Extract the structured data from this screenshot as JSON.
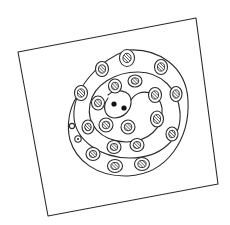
{
  "diagram": {
    "colors": {
      "ink": "#2b2b2b",
      "background": "#ffffff",
      "dot": "#111111"
    },
    "frame": {
      "corners": [
        [
          18,
          52
        ],
        [
          196,
          18
        ],
        [
          218,
          184
        ],
        [
          48,
          216
        ]
      ]
    },
    "center_dots": [
      {
        "cx": 114,
        "cy": 104,
        "r": 2.6
      },
      {
        "cx": 124,
        "cy": 108,
        "r": 2.6
      }
    ],
    "cells": [
      {
        "cx": 127,
        "cy": 58,
        "rx": 7.5,
        "ry": 8.5,
        "ring": "outer"
      },
      {
        "cx": 102,
        "cy": 69,
        "rx": 6.5,
        "ry": 7.5,
        "ring": "outer"
      },
      {
        "cx": 161,
        "cy": 67,
        "rx": 6.5,
        "ry": 7.5,
        "ring": "outer"
      },
      {
        "cx": 81,
        "cy": 93,
        "rx": 6.5,
        "ry": 7.5,
        "ring": "outer"
      },
      {
        "cx": 176,
        "cy": 94,
        "rx": 6,
        "ry": 7.5,
        "ring": "outer"
      },
      {
        "cx": 172,
        "cy": 134,
        "rx": 6,
        "ry": 7,
        "ring": "outer"
      },
      {
        "cx": 93,
        "cy": 154,
        "rx": 7,
        "ry": 6.5,
        "ring": "outer"
      },
      {
        "cx": 115,
        "cy": 166,
        "rx": 7.5,
        "ry": 6.5,
        "ring": "outer"
      },
      {
        "cx": 142,
        "cy": 164,
        "rx": 7.5,
        "ry": 6.5,
        "ring": "outer"
      },
      {
        "cx": 115,
        "cy": 86,
        "rx": 6.5,
        "ry": 7,
        "ring": "middle"
      },
      {
        "cx": 135,
        "cy": 81,
        "rx": 7,
        "ry": 6,
        "ring": "middle"
      },
      {
        "cx": 98,
        "cy": 103,
        "rx": 6.5,
        "ry": 7,
        "ring": "middle"
      },
      {
        "cx": 155,
        "cy": 95,
        "rx": 6.5,
        "ry": 7.5,
        "ring": "middle"
      },
      {
        "cx": 157,
        "cy": 119,
        "rx": 6.5,
        "ry": 8,
        "ring": "middle"
      },
      {
        "cx": 88,
        "cy": 127,
        "rx": 6,
        "ry": 7,
        "ring": "middle"
      },
      {
        "cx": 106,
        "cy": 125,
        "rx": 7,
        "ry": 7,
        "ring": "middle"
      },
      {
        "cx": 128,
        "cy": 127,
        "rx": 7,
        "ry": 7,
        "ring": "middle"
      },
      {
        "cx": 114,
        "cy": 147,
        "rx": 7,
        "ry": 6.5,
        "ring": "middle"
      },
      {
        "cx": 137,
        "cy": 145,
        "rx": 7,
        "ry": 6.5,
        "ring": "middle"
      }
    ],
    "small_cells": [
      {
        "cx": 72,
        "cy": 126,
        "r": 2.6,
        "has_dot": false
      },
      {
        "cx": 78,
        "cy": 139,
        "r": 3.2,
        "has_dot": true
      }
    ],
    "spiral_paths": [
      "M 108 95 C 116 88, 130 90, 131 100 C 132 110, 124 118, 114 118 C 104 117, 102 106, 108 98",
      "M 131 100 C 140 86, 160 92, 162 108 C 164 128, 148 142, 126 142 C 100 141, 86 124, 90 104 C 94 84, 116 72, 138 72 C 162 72, 178 90, 180 112",
      "M 180 112 C 182 140, 160 158, 130 158 C 100 158, 76 140, 74 118 C 72 90, 98 60, 128 50 C 158 48, 186 66, 188 100 C 190 138, 168 174, 128 176 C 96 177, 76 160, 70 140 C 66 124, 70 108, 76 98"
    ]
  }
}
